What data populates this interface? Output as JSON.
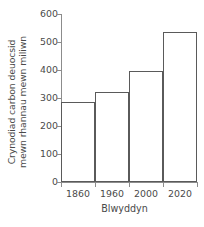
{
  "chart_data": {
    "type": "bar",
    "title": "",
    "subtitle": "",
    "xlabel": "Blwyddyn",
    "ylabel": "Crynodiad carbon deuocsid mewn rhannau mewn miliwn",
    "categories": [
      "1860",
      "1960",
      "2000",
      "2020"
    ],
    "values": [
      285,
      320,
      397,
      535
    ],
    "series": [
      {
        "name": "Crynodiad carbon deuocsid",
        "values": [
          285,
          320,
          397,
          535
        ]
      }
    ],
    "ylim": [
      0,
      600
    ],
    "yticks": [
      0,
      100,
      200,
      300,
      400,
      500,
      600
    ],
    "ytick_labels": [
      "0",
      "100",
      "200",
      "300",
      "400",
      "500",
      "600"
    ],
    "grid": false,
    "legend": false,
    "legend_position": "none",
    "annotations": [],
    "bar_style": {
      "fill": "#ffffff",
      "edge": "#5a5a5a",
      "gap": 0
    },
    "axis_color": "#8c8c8c",
    "text_color": "#4a4a4a"
  }
}
